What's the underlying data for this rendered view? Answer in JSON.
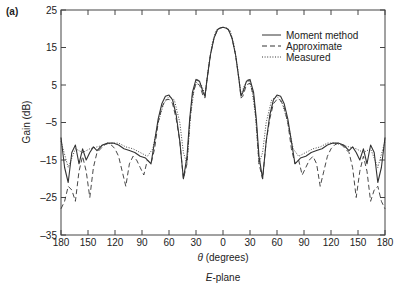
{
  "panel_label": "(a)",
  "subtitle": "E-plane",
  "chart_data": {
    "type": "line",
    "title": "",
    "subtitle": "E-plane",
    "panel_label": "(a)",
    "xlabel": "θ (degrees)",
    "ylabel": "Gain (dB)",
    "xlim": [
      -180,
      180
    ],
    "ylim": [
      -35,
      25
    ],
    "x_ticks": [
      -180,
      -150,
      -120,
      -90,
      -60,
      -30,
      0,
      30,
      60,
      90,
      120,
      150,
      180
    ],
    "x_tick_labels": [
      "180",
      "150",
      "120",
      "90",
      "60",
      "30",
      "0",
      "30",
      "60",
      "90",
      "120",
      "150",
      "180"
    ],
    "y_ticks": [
      25,
      15,
      5,
      -5,
      -15,
      -25,
      -35
    ],
    "y_tick_labels": [
      "25",
      "15",
      "5",
      "–5",
      "–15",
      "–25",
      "–35"
    ],
    "grid": false,
    "legend_position": "upper right",
    "legend": [
      "Moment method",
      "Approximate",
      "Measured"
    ],
    "series": [
      {
        "name": "Moment method",
        "style": "solid",
        "x": [
          -180,
          -176,
          -172,
          -168,
          -164,
          -160,
          -156,
          -152,
          -148,
          -144,
          -140,
          -134,
          -128,
          -122,
          -116,
          -110,
          -104,
          -98,
          -92,
          -86,
          -80,
          -76,
          -72,
          -68,
          -64,
          -60,
          -56,
          -52,
          -48,
          -44,
          -40,
          -37,
          -34,
          -30,
          -26,
          -22,
          -20,
          -18,
          -14,
          -10,
          -6,
          -3,
          0,
          3,
          6,
          10,
          14,
          18,
          20,
          22,
          26,
          30,
          34,
          37,
          40,
          44,
          48,
          52,
          56,
          60,
          64,
          68,
          72,
          76,
          80,
          86,
          92,
          98,
          104,
          110,
          116,
          122,
          128,
          134,
          140,
          144,
          148,
          152,
          156,
          160,
          164,
          168,
          172,
          176,
          180
        ],
        "y": [
          -9,
          -17,
          -21,
          -13,
          -11,
          -16,
          -12,
          -15,
          -13,
          -11.5,
          -12.5,
          -11,
          -10.5,
          -10.5,
          -11,
          -12,
          -12.5,
          -13,
          -14,
          -14.5,
          -16,
          -10,
          -4,
          0,
          2,
          2.3,
          1,
          -3,
          -10,
          -20,
          -14,
          -4,
          3,
          6.5,
          6,
          3,
          2,
          6,
          13,
          17.5,
          19.8,
          20.2,
          20.4,
          20.2,
          19.8,
          17.5,
          13,
          6,
          2,
          3,
          6,
          6.5,
          3,
          -4,
          -14,
          -20,
          -10,
          -3,
          1,
          2.3,
          2,
          0,
          -4,
          -10,
          -16,
          -14.5,
          -14,
          -13,
          -12.5,
          -12,
          -11,
          -10.5,
          -10.5,
          -11,
          -12.5,
          -11.5,
          -13,
          -15,
          -12,
          -16,
          -11,
          -13,
          -21,
          -17,
          -9
        ]
      },
      {
        "name": "Approximate",
        "style": "dashed",
        "x": [
          -180,
          -176,
          -172,
          -168,
          -164,
          -160,
          -156,
          -152,
          -148,
          -144,
          -140,
          -136,
          -132,
          -128,
          -124,
          -120,
          -116,
          -112,
          -108,
          -104,
          -100,
          -96,
          -92,
          -88,
          -84,
          -80,
          -76,
          -72,
          -68,
          -64,
          -60,
          -56,
          -52,
          -48,
          -44,
          -40,
          -37,
          -34,
          -30,
          -26,
          -22,
          -20,
          -18,
          -14,
          -10,
          -6,
          -3,
          0,
          3,
          6,
          10,
          14,
          18,
          20,
          22,
          26,
          30,
          34,
          37,
          40,
          44,
          48,
          52,
          56,
          60,
          64,
          68,
          72,
          76,
          80,
          84,
          88,
          92,
          96,
          100,
          104,
          108,
          112,
          116,
          120,
          124,
          128,
          132,
          136,
          140,
          144,
          148,
          152,
          156,
          160,
          164,
          168,
          172,
          176,
          180
        ],
        "y": [
          -28,
          -26,
          -22,
          -23,
          -26,
          -18,
          -14,
          -18,
          -25,
          -17,
          -13,
          -12,
          -11,
          -10.5,
          -11,
          -12,
          -14,
          -18,
          -22,
          -16,
          -14,
          -15,
          -17,
          -19,
          -15,
          -16,
          -12,
          -5,
          -1,
          1,
          1.2,
          0,
          -4,
          -10,
          -20,
          -16,
          -5,
          2,
          5.5,
          5,
          2,
          1.5,
          6,
          13,
          17.5,
          19.8,
          20.2,
          20.4,
          20.2,
          19.8,
          17.5,
          13,
          6,
          1.5,
          2,
          5,
          5.5,
          2,
          -5,
          -16,
          -20,
          -10,
          -4,
          0,
          1.2,
          1,
          -1,
          -5,
          -12,
          -16,
          -15,
          -19,
          -17,
          -15,
          -14,
          -16,
          -22,
          -18,
          -14,
          -12,
          -11,
          -10.5,
          -11,
          -12,
          -13,
          -17,
          -25,
          -18,
          -14,
          -18,
          -26,
          -23,
          -22,
          -26,
          -28
        ]
      },
      {
        "name": "Measured",
        "style": "dotted",
        "x": [
          -180,
          -172,
          -164,
          -156,
          -148,
          -140,
          -132,
          -124,
          -116,
          -108,
          -100,
          -92,
          -84,
          -78,
          -72,
          -66,
          -60,
          -54,
          -48,
          -44,
          -40,
          -36,
          -32,
          -28,
          -24,
          -20,
          -16,
          -12,
          -8,
          -4,
          0,
          4,
          8,
          12,
          16,
          20,
          24,
          28,
          32,
          36,
          40,
          44,
          48,
          54,
          60,
          66,
          72,
          78,
          84,
          92,
          100,
          108,
          116,
          124,
          132,
          140,
          148,
          156,
          164,
          172,
          180
        ],
        "y": [
          -10,
          -17,
          -12,
          -13,
          -12,
          -11.5,
          -11,
          -10.5,
          -10.5,
          -11.5,
          -12,
          -13,
          -14,
          -12,
          -5,
          0,
          2,
          1,
          -5,
          -13,
          -16,
          -3,
          4,
          6.5,
          5,
          2.5,
          10,
          16,
          19.5,
          20.2,
          20.4,
          20.2,
          19.5,
          16,
          10,
          2.5,
          5,
          6.5,
          4,
          -3,
          -16,
          -13,
          -5,
          1,
          2,
          0,
          -5,
          -12,
          -14,
          -13,
          -12,
          -11.5,
          -10.5,
          -10.5,
          -11,
          -11.5,
          -12,
          -13,
          -12,
          -17,
          -10
        ]
      }
    ]
  }
}
